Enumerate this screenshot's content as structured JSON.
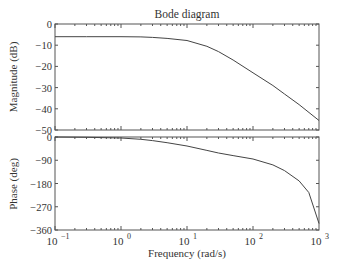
{
  "chart_data": [
    {
      "type": "line",
      "title": "Bode diagram",
      "xlabel": "",
      "ylabel": "Magnitude (dB)",
      "xscale": "log",
      "xlim": [
        0.1,
        1000
      ],
      "ylim": [
        -50,
        0
      ],
      "yticks": [
        0,
        -10,
        -20,
        -30,
        -40,
        -50
      ],
      "grid": false,
      "series": [
        {
          "name": "magnitude",
          "x": [
            0.1,
            0.3,
            1,
            2,
            3,
            5,
            10,
            20,
            30,
            50,
            100,
            200,
            300,
            500,
            1000
          ],
          "y": [
            -6,
            -6,
            -6,
            -6.1,
            -6.3,
            -6.8,
            -7.8,
            -10.5,
            -13,
            -17,
            -23,
            -29,
            -33,
            -38,
            -45.5
          ]
        }
      ]
    },
    {
      "type": "line",
      "title": "",
      "xlabel": "Frequency (rad/s)",
      "ylabel": "Phase (deg)",
      "xscale": "log",
      "xlim": [
        0.1,
        1000
      ],
      "ylim": [
        -360,
        0
      ],
      "yticks": [
        0,
        -90,
        -180,
        -270,
        -360
      ],
      "xticks": [
        "10^-1",
        "10^0",
        "10^1",
        "10^2",
        "10^3"
      ],
      "grid": false,
      "series": [
        {
          "name": "phase",
          "x": [
            0.1,
            0.3,
            1,
            2,
            3,
            5,
            10,
            20,
            30,
            50,
            100,
            200,
            300,
            500,
            700,
            1000
          ],
          "y": [
            0,
            -1,
            -4,
            -9,
            -14,
            -22,
            -35,
            -52,
            -62,
            -72,
            -85,
            -108,
            -130,
            -170,
            -215,
            -335
          ]
        }
      ]
    }
  ],
  "labels": {
    "title": "Bode diagram",
    "mag_ylabel": "Magnitude (dB)",
    "phase_ylabel": "Phase (deg)",
    "xlabel": "Frequency (rad/s)",
    "mag_ticks": [
      "0",
      "−10",
      "−20",
      "−30",
      "−40",
      "−50"
    ],
    "phase_ticks": [
      "0",
      "−90",
      "−180",
      "−270",
      "−360"
    ],
    "x_ticks_base": [
      "10",
      "10",
      "10",
      "10",
      "10"
    ],
    "x_ticks_exp": [
      "−1",
      "0",
      "1",
      "2",
      "3"
    ]
  },
  "colors": {
    "axis": "#555555",
    "line": "#444444",
    "text": "#333333"
  }
}
